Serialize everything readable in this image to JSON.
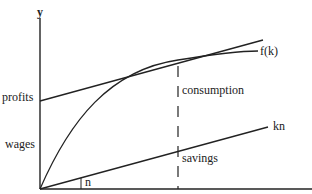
{
  "diagram": {
    "labels": {
      "y_axis": "y",
      "profits": "profits",
      "wages": "wages",
      "consumption": "consumption",
      "savings": "savings",
      "angle": "n",
      "production_curve": "f(k)",
      "investment_line": "kn"
    },
    "colors": {
      "stroke": "#222222",
      "background": "#ffffff"
    }
  }
}
